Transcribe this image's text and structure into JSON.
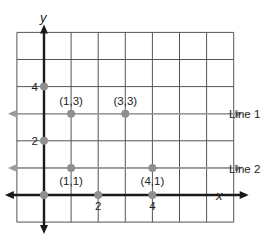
{
  "chart_data": {
    "type": "scatter",
    "title": "",
    "xlabel": "x",
    "ylabel": "y",
    "xlim": [
      -1,
      6
    ],
    "ylim": [
      -1,
      6
    ],
    "grid": true,
    "x_ticks": [
      {
        "value": 2,
        "label": "2"
      },
      {
        "value": 4,
        "label": "4"
      }
    ],
    "y_ticks": [
      {
        "value": 2,
        "label": "2"
      },
      {
        "value": 4,
        "label": "4"
      }
    ],
    "points": [
      {
        "x": 1,
        "y": 3,
        "label": "(1,3)"
      },
      {
        "x": 3,
        "y": 3,
        "label": "(3,3)"
      },
      {
        "x": 1,
        "y": 1,
        "label": "(1,1)"
      },
      {
        "x": 4,
        "y": 1,
        "label": "(4,1)"
      },
      {
        "x": 0,
        "y": 0,
        "label": ""
      },
      {
        "x": 2,
        "y": 0,
        "label": ""
      },
      {
        "x": 4,
        "y": 0,
        "label": ""
      },
      {
        "x": 0,
        "y": 2,
        "label": ""
      },
      {
        "x": 0,
        "y": 4,
        "label": ""
      }
    ],
    "lines": [
      {
        "name": "Line 1",
        "y": 3
      },
      {
        "name": "Line 2",
        "y": 1
      }
    ],
    "colors": {
      "axis": "#1a1a1a",
      "grid": "#555555",
      "line": "#9a9a9a",
      "point": "#8f8f8f"
    }
  }
}
